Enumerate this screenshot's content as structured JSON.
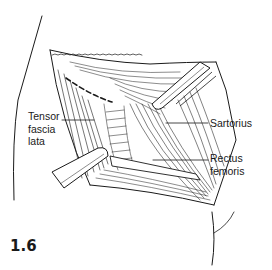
{
  "figure": {
    "number": "1.6",
    "labels": {
      "tensor": [
        "Tensor",
        "fascia",
        "lata"
      ],
      "sartorius": "Sartorius",
      "rectus": [
        "Rectus",
        "femoris"
      ]
    },
    "colors": {
      "ink": "#1a1a1a",
      "background": "#ffffff"
    }
  }
}
